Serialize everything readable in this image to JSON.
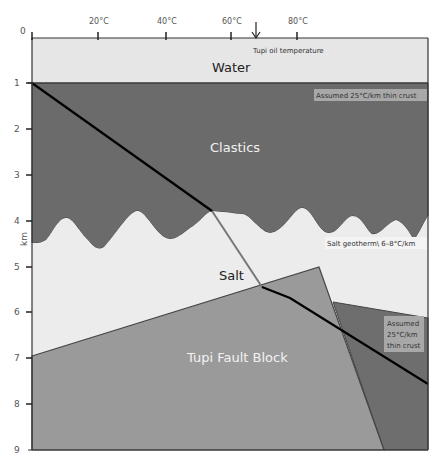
{
  "diagram": {
    "axis_top": {
      "origin_label": "0",
      "ticks": [
        "20°C",
        "40°C",
        "60°C",
        "80°C"
      ],
      "marker_label": "Tupi oil temperature"
    },
    "axis_left": {
      "unit_label": "km",
      "ticks": [
        "1",
        "2",
        "3",
        "4",
        "5",
        "6",
        "7",
        "8",
        "9"
      ]
    },
    "regions": {
      "water": "Water",
      "clastics": "Clastics",
      "salt": "Salt",
      "fault_block": "Tupi Fault Block"
    },
    "annotations": {
      "thin_crust_top": "Assumed 25°C/km thin crust",
      "salt_geotherm": "Salt geotherm\\ 6–8°C/km",
      "thin_crust_right_line1": "Assumed",
      "thin_crust_right_line2": "25°C/km",
      "thin_crust_right_line3": "thin crust"
    },
    "colors": {
      "water": "#e6e6e6",
      "clastics": "#6b6b6b",
      "salt": "#ececec",
      "fault_block": "#9a9a9a",
      "right_block": "#6e6e6e",
      "geotherm": "#000000"
    }
  }
}
